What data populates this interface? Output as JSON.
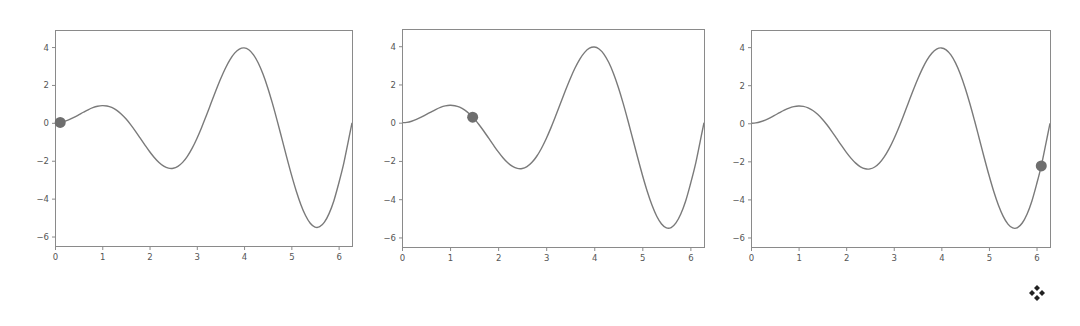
{
  "chart_data": [
    {
      "type": "line",
      "title": "",
      "xlabel": "",
      "ylabel": "",
      "function": "y = x*sin(2x)",
      "xlim": [
        0,
        6.2832
      ],
      "ylim": [
        -6.5,
        4.9
      ],
      "xticks": [
        0,
        1,
        2,
        3,
        4,
        5,
        6
      ],
      "yticks": [
        4,
        2,
        0,
        -2,
        -4,
        -6
      ],
      "ytick_labels": [
        "4",
        "2",
        "0",
        "−2",
        "−4",
        "−6"
      ],
      "grid": false,
      "series": [
        {
          "name": "curve",
          "x": [
            0,
            0.1,
            0.2,
            0.3,
            0.4,
            0.5,
            0.6,
            0.7,
            0.8,
            0.9,
            1.0,
            1.1,
            1.2,
            1.3,
            1.4,
            1.5,
            1.6,
            1.7,
            1.8,
            1.9,
            2.0,
            2.1,
            2.2,
            2.3,
            2.4,
            2.5,
            2.6,
            2.7,
            2.8,
            2.9,
            3.0,
            3.1,
            3.2,
            3.3,
            3.4,
            3.5,
            3.6,
            3.7,
            3.8,
            3.9,
            4.0,
            4.1,
            4.2,
            4.3,
            4.4,
            4.5,
            4.6,
            4.7,
            4.8,
            4.9,
            5.0,
            5.1,
            5.2,
            5.3,
            5.4,
            5.5,
            5.6,
            5.7,
            5.8,
            5.9,
            6.0,
            6.1,
            6.2,
            6.2832
          ],
          "y": [
            0,
            0.0199,
            0.0779,
            0.1694,
            0.2869,
            0.4207,
            0.5592,
            0.6898,
            0.7997,
            0.8765,
            0.9093,
            0.8894,
            0.8106,
            0.6702,
            0.469,
            0.2117,
            -0.0934,
            -0.4343,
            -0.7966,
            -1.1626,
            -1.5136,
            -1.8303,
            -2.0935,
            -2.2855,
            -2.3908,
            -2.3973,
            -2.2971,
            -2.0866,
            -1.7676,
            -1.3473,
            -0.8382,
            -0.2577,
            0.3728,
            1.028,
            1.6799,
            2.2995,
            2.8573,
            3.3252,
            3.678,
            3.8942,
            3.9574,
            3.8569,
            3.5893,
            3.1579,
            2.5736,
            1.8545,
            1.0253,
            0.1166,
            -0.8366,
            -1.7959,
            -2.7201,
            -3.57,
            -4.3046,
            -4.8893,
            -5.2969,
            -5.4999,
            -5.4835,
            -5.24,
            -4.7769,
            -4.1082,
            -3.2195,
            -2.2357,
            -1.0267,
            0
          ]
        },
        {
          "name": "marker",
          "type": "scatter",
          "x": [
            0.11
          ],
          "y": [
            0.02
          ]
        }
      ]
    },
    {
      "type": "line",
      "title": "",
      "xlabel": "",
      "ylabel": "",
      "function": "y = x*sin(2x)",
      "xlim": [
        0,
        6.2832
      ],
      "ylim": [
        -6.5,
        4.9
      ],
      "xticks": [
        0,
        1,
        2,
        3,
        4,
        5,
        6
      ],
      "yticks": [
        4,
        2,
        0,
        -2,
        -4,
        -6
      ],
      "grid": false,
      "series": [
        {
          "name": "curve",
          "same_as_panel": 0
        },
        {
          "name": "marker",
          "type": "scatter",
          "x": [
            1.47
          ],
          "y": [
            0.29
          ]
        }
      ]
    },
    {
      "type": "line",
      "title": "",
      "xlabel": "",
      "ylabel": "",
      "function": "y = x*sin(2x)",
      "xlim": [
        0,
        6.2832
      ],
      "ylim": [
        -6.5,
        4.9
      ],
      "xticks": [
        0,
        1,
        2,
        3,
        4,
        5,
        6
      ],
      "yticks": [
        4,
        2,
        0,
        -2,
        -4,
        -6
      ],
      "grid": false,
      "series": [
        {
          "name": "curve",
          "same_as_panel": 0
        },
        {
          "name": "marker",
          "type": "scatter",
          "x": [
            6.1
          ],
          "y": [
            -2.24
          ]
        }
      ]
    }
  ],
  "panels": [
    {
      "left": 55,
      "top": 30,
      "width": 297,
      "height": 216
    },
    {
      "left": 402,
      "top": 29,
      "width": 302,
      "height": 218
    },
    {
      "left": 751,
      "top": 30,
      "width": 299,
      "height": 217
    }
  ],
  "style": {
    "curve_color": "#7a7a7a",
    "marker_color": "#6e6e6e",
    "frame_color": "#8a8a8a"
  },
  "icons": {
    "corner": "four-diamonds-icon"
  }
}
